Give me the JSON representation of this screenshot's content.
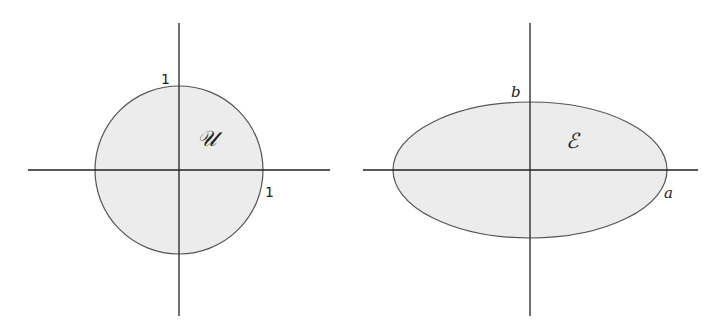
{
  "colors": {
    "fill": "#ececec",
    "stroke": "#555555",
    "axis": "#222222",
    "background": "#ffffff"
  },
  "figures": [
    {
      "name": "unit-disk",
      "shape": "circle",
      "region_label": "𝒰",
      "top_label": "1",
      "right_label": "1"
    },
    {
      "name": "ellipse",
      "shape": "ellipse",
      "region_label": "ℰ",
      "top_label": "b",
      "right_label": "a"
    }
  ]
}
